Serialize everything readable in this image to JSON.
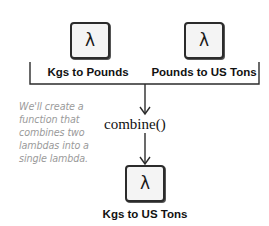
{
  "diagram": {
    "inputs": [
      {
        "glyph": "λ",
        "label": "Kgs to Pounds",
        "icon": "lambda-icon"
      },
      {
        "glyph": "λ",
        "label": "Pounds to US Tons",
        "icon": "lambda-icon"
      }
    ],
    "operation": {
      "label": "combine()"
    },
    "output": {
      "glyph": "λ",
      "label": "Kgs to US Tons",
      "icon": "lambda-icon"
    },
    "annotation": {
      "lines": [
        "We'll create a",
        "function that",
        "combines two",
        "lambdas into a",
        "single lambda."
      ]
    },
    "colors": {
      "line": "#2b2b2b",
      "box_fill": "#f4f4f4",
      "note_text": "#9a9a9a"
    }
  }
}
